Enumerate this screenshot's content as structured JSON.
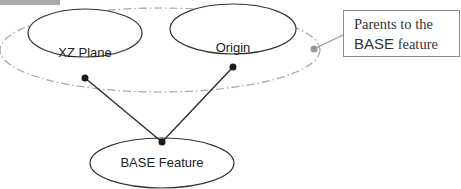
{
  "diagram": {
    "nodes": [
      {
        "id": "xz_plane",
        "label": "XZ Plane"
      },
      {
        "id": "origin",
        "label": "Origin"
      },
      {
        "id": "base_feature",
        "label": "BASE Feature"
      }
    ],
    "edges": [
      {
        "from": "xz_plane",
        "to": "base_feature"
      },
      {
        "from": "origin",
        "to": "base_feature"
      }
    ],
    "group": {
      "members": [
        "xz_plane",
        "origin"
      ],
      "style": "dash-dot ellipse"
    },
    "callout": {
      "line1": "Parents to the",
      "line2_prefix": "BASE",
      "line2_suffix": " feature"
    },
    "colors": {
      "line": "#333333",
      "group_outline": "#a0a0a0",
      "callout_border": "#8a8a8a",
      "dot": "#1a1a1a",
      "callout_dot": "#999999"
    }
  }
}
